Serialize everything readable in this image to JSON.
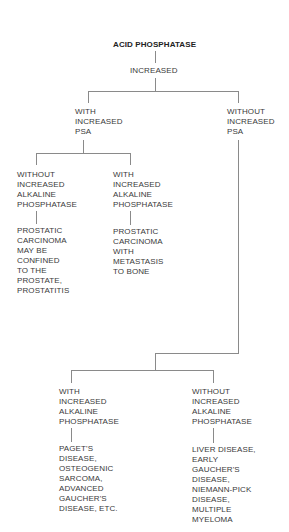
{
  "diagram": {
    "root": "ACID PHOSPHATASE",
    "level1": "INCREASED",
    "branch_with_psa": "WITH\nINCREASED\nPSA",
    "branch_without_psa": "WITHOUT\nINCREASED\nPSA",
    "with_psa_children": [
      {
        "condition": "WITHOUT\nINCREASED\nALKALINE\nPHOSPHATASE",
        "result": "PROSTATIC\nCARCINOMA\nMAY BE\nCONFINED\nTO THE\nPROSTATE,\nPROSTATITIS"
      },
      {
        "condition": "WITH\nINCREASED\nALKALINE\nPHOSPHATASE",
        "result": "PROSTATIC\nCARCINOMA\nWITH\nMETASTASIS\nTO BONE"
      }
    ],
    "without_psa_children": [
      {
        "condition": "WITH\nINCREASED\nALKALINE\nPHOSPHATASE",
        "result": "PAGET'S\nDISEASE,\nOSTEOGENIC\nSARCOMA,\nADVANCED\nGAUCHER'S\nDISEASE, ETC."
      },
      {
        "condition": "WITHOUT\nINCREASED\nALKALINE\nPHOSPHATASE",
        "result": "LIVER DISEASE,\nEARLY\nGAUCHER'S\nDISEASE,\nNIEMANN-PICK\nDISEASE,\nMULTIPLE\nMYELOMA"
      }
    ]
  },
  "colors": {
    "text": "#3a3a3a",
    "lines": "#8a8a8a",
    "background": "#ffffff"
  }
}
